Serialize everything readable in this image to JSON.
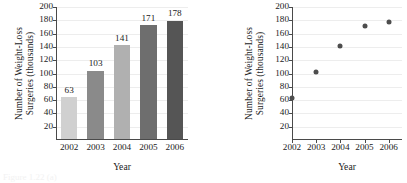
{
  "figure": {
    "caption_fragment": "Figure 1.22 (a)"
  },
  "chart_data": [
    {
      "type": "bar",
      "title": "",
      "categories": [
        "2002",
        "2003",
        "2004",
        "2005",
        "2006"
      ],
      "values": [
        63,
        103,
        141,
        171,
        178
      ],
      "data_labels": [
        "63",
        "103",
        "141",
        "171",
        "178"
      ],
      "bar_colors": [
        "#d0d0d0",
        "#8a8a8a",
        "#b0b0b0",
        "#6e6e6e",
        "#555555"
      ],
      "xlabel": "Year",
      "ylabel_line1": "Number of Weight-Loss",
      "ylabel_line2": "Surgeries (thousands)",
      "ylim": [
        0,
        200
      ],
      "ytick_labels": [
        "200",
        "180",
        "160",
        "140",
        "120",
        "100",
        "80",
        "60",
        "40",
        "20"
      ],
      "ytick_values": [
        200,
        180,
        160,
        140,
        120,
        100,
        80,
        60,
        40,
        20
      ],
      "grid": true,
      "legend": "none"
    },
    {
      "type": "scatter",
      "title": "",
      "x": [
        "2002",
        "2003",
        "2004",
        "2005",
        "2006"
      ],
      "values": [
        63,
        103,
        141,
        171,
        178
      ],
      "point_color": "#4d4d4d",
      "xlabel": "Year",
      "ylabel_line1": "Number of Weight-Loss",
      "ylabel_line2": "Surgeries (thousands)",
      "ylim": [
        0,
        200
      ],
      "ytick_labels": [
        "200",
        "180",
        "160",
        "140",
        "120",
        "100",
        "80",
        "60",
        "40",
        "20"
      ],
      "ytick_values": [
        200,
        180,
        160,
        140,
        120,
        100,
        80,
        60,
        40,
        20
      ],
      "xtick_labels": [
        "2002",
        "2003",
        "2004",
        "2005",
        "2006"
      ],
      "grid": true,
      "legend": "none"
    }
  ]
}
